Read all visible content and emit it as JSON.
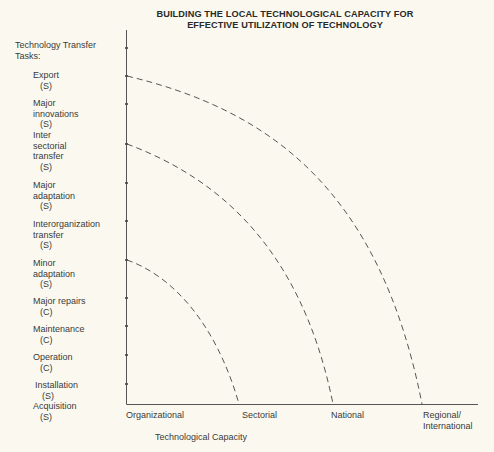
{
  "title": {
    "line1": "BUILDING THE LOCAL TECHNOLOGICAL CAPACITY FOR",
    "line2": "EFFECTIVE UTILIZATION OF TECHNOLOGY"
  },
  "y_axis": {
    "heading_line1": "Technology Transfer",
    "heading_line2": "Tasks:",
    "tasks": [
      {
        "lines": [
          "Export"
        ],
        "code": "(S)"
      },
      {
        "lines": [
          "Major",
          "innovations"
        ],
        "code": "(S)"
      },
      {
        "lines": [
          "Inter",
          "sectorial",
          "transfer"
        ],
        "code": "(S)"
      },
      {
        "lines": [
          "Major",
          "adaptation"
        ],
        "code": "(S)"
      },
      {
        "lines": [
          "Interorganization",
          "transfer"
        ],
        "code": "(S)"
      },
      {
        "lines": [
          "Minor",
          "adaptation"
        ],
        "code": "(S)"
      },
      {
        "lines": [
          "Major repairs"
        ],
        "code": "(C)"
      },
      {
        "lines": [
          "Maintenance"
        ],
        "code": "(C)"
      },
      {
        "lines": [
          "Operation"
        ],
        "code": "(C)"
      },
      {
        "lines": [
          "Installation"
        ],
        "code": "(S)"
      },
      {
        "lines": [
          "Acquisition"
        ],
        "code": "(S)"
      }
    ]
  },
  "x_axis": {
    "title": "Technological Capacity",
    "labels": [
      "Organizational",
      "Sectorial",
      "National",
      "Regional/",
      "International"
    ]
  },
  "colors": {
    "background": "#fbf9ef",
    "ink": "#3a3a3a"
  },
  "diagram": {
    "type": "capacity frontier diagram",
    "curves": [
      {
        "from_task": "Minor adaptation",
        "to_level": "Sectorial",
        "style": "dashed"
      },
      {
        "from_task": "Inter sectorial transfer",
        "to_level": "National",
        "style": "dashed"
      },
      {
        "from_task": "Export",
        "to_level": "Regional/International",
        "style": "dashed"
      }
    ]
  }
}
